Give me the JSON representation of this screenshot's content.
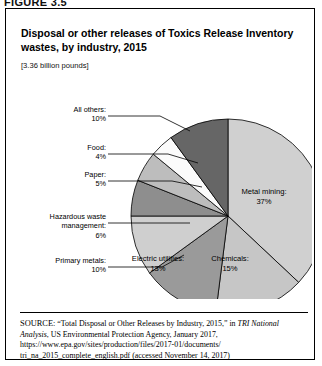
{
  "figure": {
    "label": "FIGURE 3.5"
  },
  "chart_title": "Disposal or other releases of Toxics Release Inventory wastes, by industry, 2015",
  "chart_units": "[3.36 billion pounds]",
  "chart_data": {
    "type": "pie",
    "title": "Disposal or other releases of Toxics Release Inventory wastes, by industry, 2015",
    "subtitle": "[3.36 billion pounds]",
    "total": "3.36 billion pounds",
    "unit": "percent",
    "legend": "none",
    "categories": [
      "Metal mining",
      "Chemicals",
      "Electric utilities",
      "Primary metals",
      "Hazardous waste management",
      "Paper",
      "Food",
      "All others"
    ],
    "values": [
      37,
      15,
      13,
      10,
      6,
      5,
      4,
      10
    ],
    "labels": [
      "Metal mining: 37%",
      "Chemicals: 15%",
      "Electric utilities: 13%",
      "Primary metals: 10%",
      "Hazardous waste management: 6%",
      "Paper: 5%",
      "Food: 4%",
      "All others: 10%"
    ],
    "colors": [
      "#d0d0d0",
      "#c6c6c6",
      "#9a9a9a",
      "#cfcfcf",
      "#8e8e8e",
      "#bdbdbd",
      "#fbfbfb",
      "#666666"
    ],
    "slices": [
      {
        "name": "Metal mining",
        "value": 37,
        "label_name": "Metal mining:",
        "label_pct": "37%",
        "color": "#d0d0d0",
        "placement": "inside"
      },
      {
        "name": "Chemicals",
        "value": 15,
        "label_name": "Chemicals:",
        "label_pct": "15%",
        "color": "#c6c6c6",
        "placement": "inside"
      },
      {
        "name": "Electric utilities",
        "value": 13,
        "label_name": "Electric utilities:",
        "label_pct": "13%",
        "color": "#9a9a9a",
        "placement": "inside"
      },
      {
        "name": "Primary metals",
        "value": 10,
        "label_name": "Primary metals:",
        "label_pct": "10%",
        "color": "#cfcfcf",
        "placement": "callout"
      },
      {
        "name": "Hazardous waste management",
        "value": 6,
        "label_name": "Hazardous waste management:",
        "label_pct": "6%",
        "color": "#8e8e8e",
        "placement": "callout"
      },
      {
        "name": "Paper",
        "value": 5,
        "label_name": "Paper:",
        "label_pct": "5%",
        "color": "#bdbdbd",
        "placement": "callout"
      },
      {
        "name": "Food",
        "value": 4,
        "label_name": "Food:",
        "label_pct": "4%",
        "color": "#fbfbfb",
        "placement": "callout"
      },
      {
        "name": "All others",
        "value": 10,
        "label_name": "All others:",
        "label_pct": "10%",
        "color": "#666666",
        "placement": "callout"
      }
    ]
  },
  "callouts": {
    "all_others_name": "All others:",
    "all_others_pct": "10%",
    "food_name": "Food:",
    "food_pct": "4%",
    "paper_name": "Paper:",
    "paper_pct": "5%",
    "hazardous_name": "Hazardous waste",
    "hazardous_name2": "management:",
    "hazardous_pct": "6%",
    "primary_metals_name": "Primary metals:",
    "primary_metals_pct": "10%"
  },
  "inside_labels": {
    "metal_mining_name": "Metal mining:",
    "metal_mining_pct": "37%",
    "chemicals_name": "Chemicals:",
    "chemicals_pct": "15%",
    "electric_name": "Electric utilities:",
    "electric_pct": "13%"
  },
  "source": {
    "prefix": "SOURCE:",
    "line1a": " “Total Disposal or Other Releases by Industry, 2015,” in ",
    "italic1": "TRI National Analysis",
    "line1b": ", US Environmental Protection Agency, January 2017, https://www.epa.gov/sites/production/files/2017-01/documents/ tri_na_2015_complete_english.pdf (accessed November 14, 2017)"
  }
}
